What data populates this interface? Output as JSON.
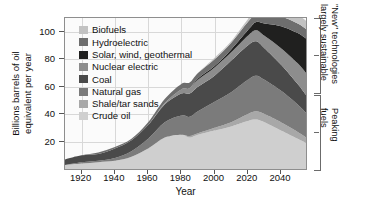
{
  "chart_data": {
    "type": "area",
    "stacked": true,
    "title": "",
    "xlabel": "Year",
    "ylabel": "Billions barrels of oil equivalent per year",
    "xlim": [
      1910,
      2055
    ],
    "ylim": [
      0,
      110
    ],
    "xticks": [
      1920,
      1940,
      1960,
      1980,
      2000,
      2020,
      2040
    ],
    "yticks": [
      20,
      40,
      60,
      80,
      100
    ],
    "grid": true,
    "legend_position": "upper-left-inside",
    "x": [
      1910,
      1920,
      1930,
      1940,
      1950,
      1960,
      1970,
      1980,
      1985,
      1990,
      2000,
      2010,
      2020,
      2025,
      2030,
      2040,
      2050,
      2055
    ],
    "series": [
      {
        "name": "Crude oil",
        "color": "#cfcfcf",
        "values": [
          3,
          4,
          5,
          6,
          9,
          15,
          23,
          25,
          23,
          25,
          28,
          31,
          35,
          36,
          34,
          28,
          22,
          19
        ]
      },
      {
        "name": "Shale/tar sands",
        "color": "#a8a8a8",
        "values": [
          0,
          0,
          0,
          0,
          0,
          0,
          0,
          0,
          1,
          1,
          2,
          3,
          5,
          6,
          6,
          6,
          5,
          4
        ]
      },
      {
        "name": "Natural gas",
        "color": "#7b7b7b",
        "values": [
          0,
          1,
          1,
          2,
          4,
          7,
          11,
          14,
          14,
          16,
          19,
          22,
          25,
          26,
          25,
          23,
          20,
          18
        ]
      },
      {
        "name": "Coal",
        "color": "#4a4a4a",
        "values": [
          4,
          5,
          5,
          7,
          8,
          10,
          13,
          16,
          17,
          18,
          19,
          23,
          25,
          25,
          23,
          19,
          15,
          13
        ]
      },
      {
        "name": "Nuclear electric",
        "color": "#8d8d8d",
        "values": [
          0,
          0,
          0,
          0,
          0,
          0,
          1,
          3,
          4,
          5,
          6,
          6,
          7,
          8,
          9,
          12,
          15,
          16
        ]
      },
      {
        "name": "Solar, wind, geothermal",
        "color": "#20201f",
        "values": [
          0,
          0,
          0,
          0,
          0,
          0,
          0,
          0,
          0,
          1,
          1,
          2,
          4,
          6,
          9,
          16,
          22,
          25
        ]
      },
      {
        "name": "Hydroelectric",
        "color": "#6e6e6e",
        "values": [
          0,
          0,
          1,
          1,
          1,
          2,
          3,
          4,
          4,
          4,
          5,
          5,
          6,
          6,
          6,
          7,
          7,
          7
        ]
      },
      {
        "name": "Biofuels",
        "color": "#c2c2c2",
        "values": [
          0,
          0,
          0,
          0,
          0,
          0,
          0,
          0,
          0,
          0,
          1,
          1,
          2,
          3,
          4,
          5,
          6,
          6
        ]
      }
    ]
  },
  "legend": {
    "items": [
      {
        "label": "Biofuels",
        "color": "#c2c2c2"
      },
      {
        "label": "Hydroelectric",
        "color": "#6e6e6e"
      },
      {
        "label": "Solar, wind, geothermal",
        "color": "#20201f"
      },
      {
        "label": "Nuclear electric",
        "color": "#8d8d8d"
      },
      {
        "label": "Coal",
        "color": "#4a4a4a"
      },
      {
        "label": "Natural gas",
        "color": "#7b7b7b"
      },
      {
        "label": "Shale/tar sands",
        "color": "#a8a8a8"
      },
      {
        "label": "Crude oil",
        "color": "#cfcfcf"
      }
    ]
  },
  "annotations": {
    "upper_bracket": {
      "line1": "\"New\" technologies",
      "line2": "largely sustainable"
    },
    "lower_bracket": {
      "line1": "Peaking",
      "line2": "fuels"
    }
  },
  "axes": {
    "ylabel_line1": "Billions barrels of oil",
    "ylabel_line2": "equivalent per year",
    "xlabel": "Year"
  }
}
